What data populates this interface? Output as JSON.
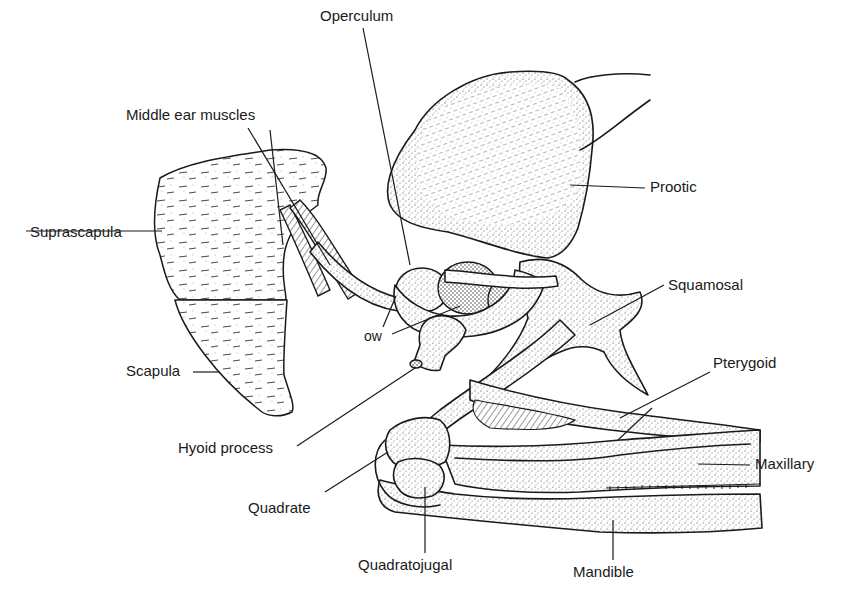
{
  "figure": {
    "labels": [
      {
        "id": "operculum",
        "text": "Operculum",
        "x": 320,
        "y": 8
      },
      {
        "id": "middle-ear-muscles",
        "text": "Middle ear muscles",
        "x": 126,
        "y": 107
      },
      {
        "id": "prootic",
        "text": "Prootic",
        "x": 650,
        "y": 178
      },
      {
        "id": "suprascapula",
        "text": "Suprascapula",
        "x": 30,
        "y": 223
      },
      {
        "id": "squamosal",
        "text": "Squamosal",
        "x": 668,
        "y": 276
      },
      {
        "id": "ow",
        "text": "ow",
        "x": 364,
        "y": 329
      },
      {
        "id": "scapula",
        "text": "Scapula",
        "x": 126,
        "y": 362
      },
      {
        "id": "pterygoid",
        "text": "Pterygoid",
        "x": 713,
        "y": 354
      },
      {
        "id": "hyoid-process",
        "text": "Hyoid process",
        "x": 178,
        "y": 440
      },
      {
        "id": "maxillary",
        "text": "Maxillary",
        "x": 755,
        "y": 455
      },
      {
        "id": "quadrate",
        "text": "Quadrate",
        "x": 248,
        "y": 500
      },
      {
        "id": "quadratojugal",
        "text": "Quadratojugal",
        "x": 358,
        "y": 557
      },
      {
        "id": "mandible",
        "text": "Mandible",
        "x": 573,
        "y": 564
      }
    ]
  }
}
